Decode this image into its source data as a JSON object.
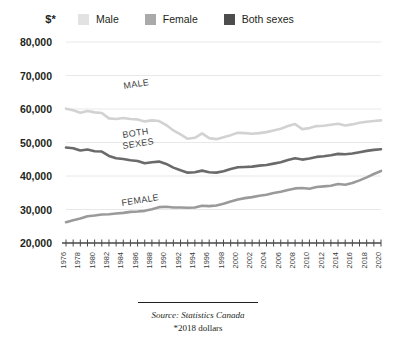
{
  "header": {
    "axis_unit_label": "$*"
  },
  "legend": {
    "position": "top",
    "items": [
      {
        "label": "Male",
        "color": "#e2e2e2"
      },
      {
        "label": "Female",
        "color": "#aaaaaa"
      },
      {
        "label": "Both sexes",
        "color": "#4d4d4d"
      }
    ]
  },
  "footer": {
    "source": "Source: Statistics Canada",
    "note": "*2018 dollars"
  },
  "inline_labels": [
    {
      "text": "MALE",
      "series": "Male"
    },
    {
      "text": "BOTH",
      "series": "Both sexes"
    },
    {
      "text": "SEXES",
      "series": "Both sexes"
    },
    {
      "text": "FEMALE",
      "series": "Female"
    }
  ],
  "chart_data": {
    "type": "line",
    "title": "",
    "xlabel": "",
    "ylabel": "$*",
    "ylim": [
      20000,
      80000
    ],
    "yticks": [
      20000,
      30000,
      40000,
      50000,
      60000,
      70000,
      80000
    ],
    "ytick_labels": [
      "20,000",
      "30,000",
      "40,000",
      "50,000",
      "60,000",
      "70,000",
      "80,000"
    ],
    "grid": true,
    "legend_position": "top",
    "x": [
      1976,
      1977,
      1978,
      1979,
      1980,
      1981,
      1982,
      1983,
      1984,
      1985,
      1986,
      1987,
      1988,
      1989,
      1990,
      1991,
      1992,
      1993,
      1994,
      1995,
      1996,
      1997,
      1998,
      1999,
      2000,
      2001,
      2002,
      2003,
      2004,
      2005,
      2006,
      2007,
      2008,
      2009,
      2010,
      2011,
      2012,
      2013,
      2014,
      2015,
      2016,
      2017,
      2018,
      2019,
      2020
    ],
    "xtick_labels": [
      "1976",
      "1978",
      "1980",
      "1982",
      "1984",
      "1986",
      "1988",
      "1990",
      "1992",
      "1994",
      "1996",
      "1998",
      "2000",
      "2002",
      "2004",
      "2006",
      "2008",
      "2010",
      "2012",
      "2014",
      "2016",
      "2018",
      "2020"
    ],
    "xtick_step": 2,
    "series": [
      {
        "name": "Male",
        "color": "#d2d2d2",
        "values": [
          60100,
          59600,
          58900,
          59400,
          59000,
          58800,
          57200,
          57000,
          57300,
          57000,
          56900,
          56300,
          56600,
          56400,
          55200,
          53600,
          52400,
          51100,
          51400,
          52700,
          51300,
          51000,
          51600,
          52200,
          52900,
          52800,
          52600,
          52800,
          53100,
          53600,
          54100,
          54900,
          55500,
          54000,
          54300,
          54900,
          55000,
          55300,
          55600,
          55100,
          55400,
          55900,
          56200,
          56400,
          56600
        ]
      },
      {
        "name": "Both sexes",
        "color": "#6a6a6a",
        "values": [
          48500,
          48300,
          47600,
          47900,
          47400,
          47300,
          46000,
          45300,
          45100,
          44700,
          44500,
          43800,
          44100,
          44300,
          43600,
          42500,
          41700,
          41000,
          41100,
          41600,
          41100,
          41000,
          41400,
          42100,
          42600,
          42700,
          42800,
          43100,
          43300,
          43700,
          44100,
          44800,
          45300,
          44900,
          45200,
          45700,
          45900,
          46200,
          46600,
          46500,
          46700,
          47100,
          47500,
          47800,
          48000
        ]
      },
      {
        "name": "Female",
        "color": "#9a9a9a",
        "values": [
          26200,
          26800,
          27300,
          28000,
          28200,
          28500,
          28600,
          28800,
          29000,
          29300,
          29400,
          29600,
          30100,
          30700,
          30800,
          30600,
          30600,
          30500,
          30600,
          31100,
          31000,
          31200,
          31700,
          32400,
          33000,
          33400,
          33700,
          34100,
          34400,
          34900,
          35300,
          35800,
          36300,
          36400,
          36200,
          36700,
          36900,
          37100,
          37600,
          37400,
          37900,
          38700,
          39600,
          40600,
          41500
        ]
      }
    ]
  }
}
